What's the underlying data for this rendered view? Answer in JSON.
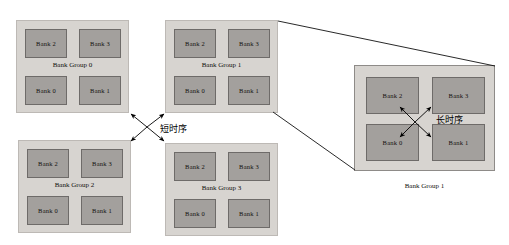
{
  "diagram": {
    "title_visible": false,
    "bank_labels": {
      "bank0": "Bank 0",
      "bank1": "Bank 1",
      "bank2": "Bank 2",
      "bank3": "Bank 3"
    },
    "groups": [
      {
        "id": "group0",
        "label": "Bank Group 0",
        "position": "top-left"
      },
      {
        "id": "group1",
        "label": "Bank Group 1",
        "position": "top-center"
      },
      {
        "id": "group2",
        "label": "Bank Group 2",
        "position": "bottom-left"
      },
      {
        "id": "group3",
        "label": "Bank Group 3",
        "position": "bottom-center"
      }
    ],
    "magnified": {
      "label": "Bank Group 1",
      "caption": "Bank Group 1",
      "timing_label": "长时序"
    },
    "inter_group_timing_label": "短时序",
    "colors": {
      "group_fill": "#d7d4d0",
      "group_border": "#bdb9b5",
      "bank_fill": "#a3a09d",
      "bank_border": "#6e6b69",
      "text": "#100e0d",
      "arrow": "#000000",
      "background": "#ffffff"
    }
  }
}
